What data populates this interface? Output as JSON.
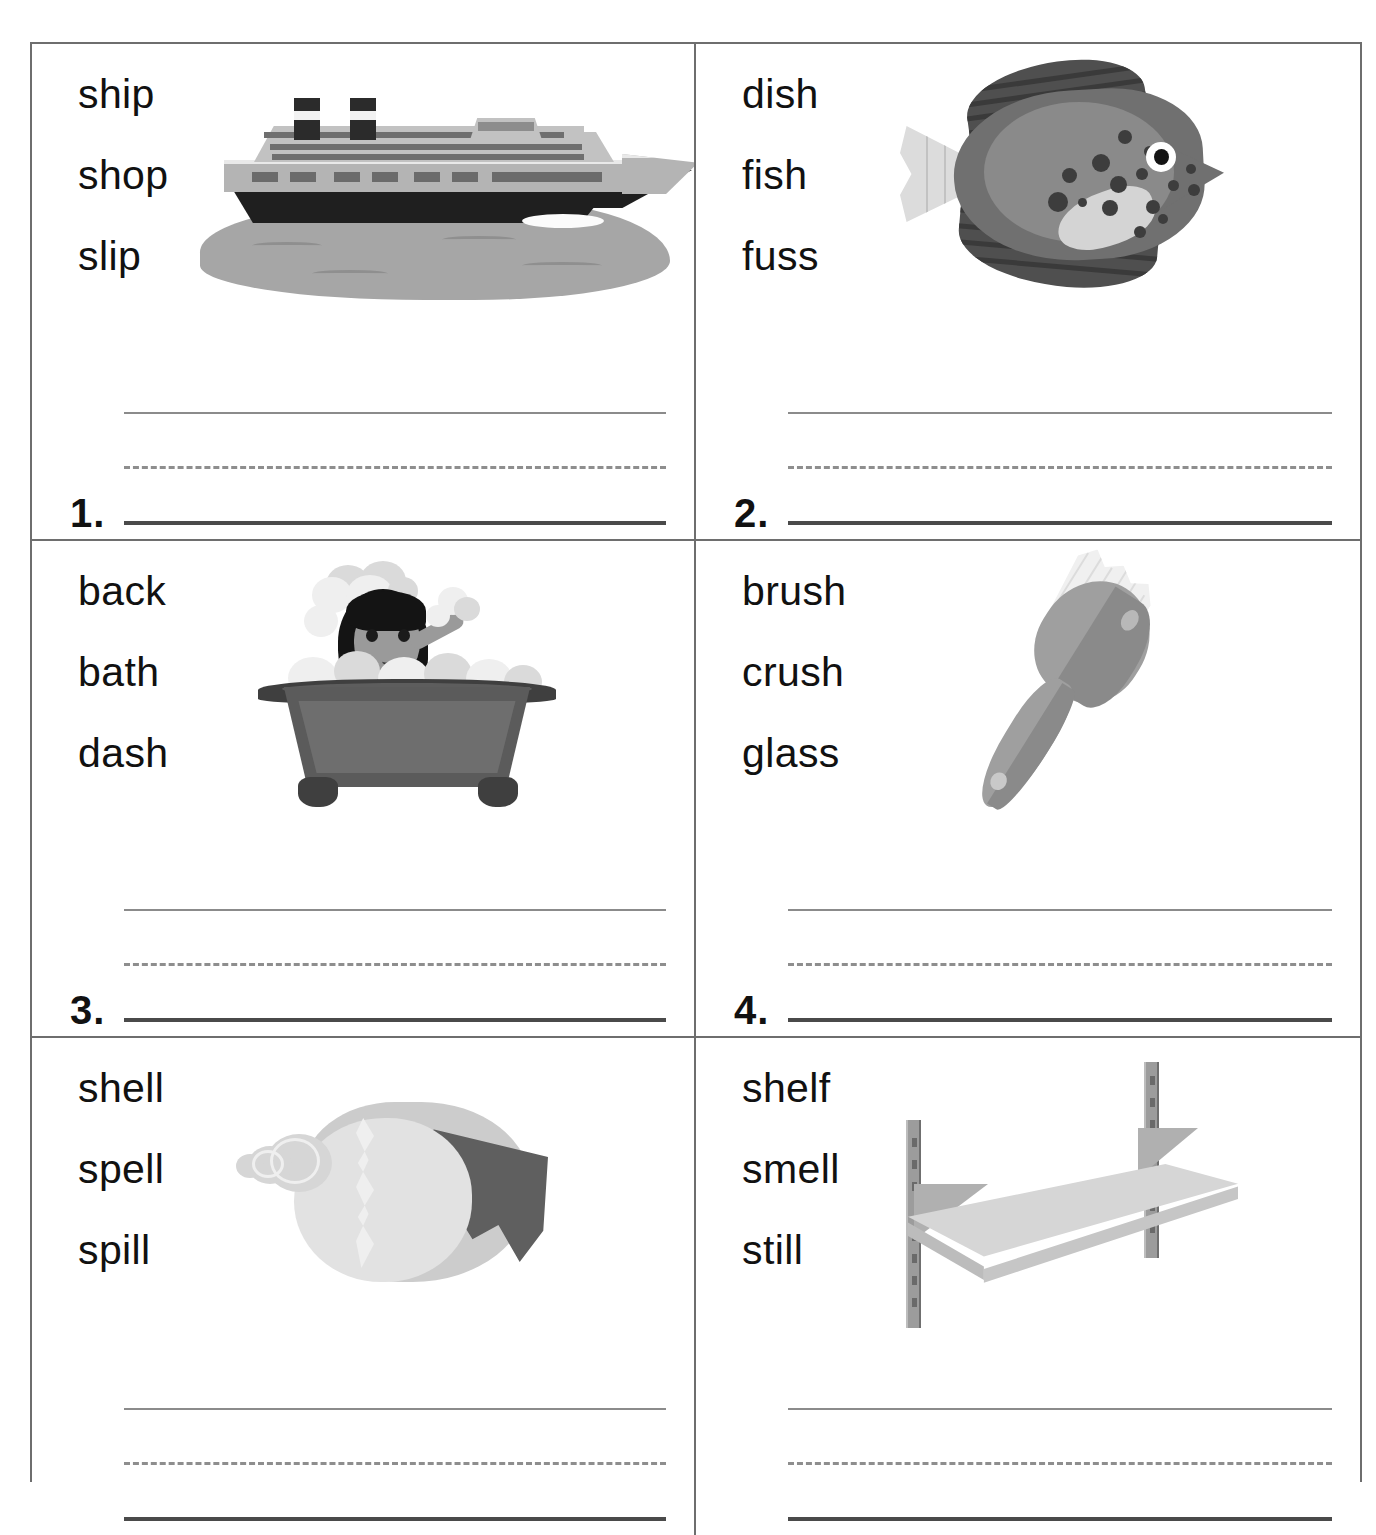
{
  "worksheet": {
    "type": "phonics-word-choice-worksheet",
    "grid": {
      "columns": 2,
      "rows": 3
    },
    "line_style": {
      "top_rule": "solid",
      "middle_rule": "dashed",
      "baseline": "solid"
    },
    "colors": {
      "border": "#6e6e6e",
      "text": "#111111",
      "rule_light": "#8b8b8b",
      "rule_dash": "#8e8e8e",
      "rule_base": "#4a4a4a",
      "background": "#ffffff"
    },
    "items": [
      {
        "number": "1.",
        "words": [
          "ship",
          "shop",
          "slip"
        ],
        "picture": "cruise-ship",
        "picture_label": "ship"
      },
      {
        "number": "2.",
        "words": [
          "dish",
          "fish",
          "fuss"
        ],
        "picture": "fish",
        "picture_label": "fish"
      },
      {
        "number": "3.",
        "words": [
          "back",
          "bath",
          "dash"
        ],
        "picture": "girl-in-bathtub",
        "picture_label": "bath"
      },
      {
        "number": "4.",
        "words": [
          "brush",
          "crush",
          "glass"
        ],
        "picture": "hair-brush",
        "picture_label": "brush"
      },
      {
        "number": "",
        "words": [
          "shell",
          "spell",
          "spill"
        ],
        "picture": "sea-shell",
        "picture_label": "shell"
      },
      {
        "number": "",
        "words": [
          "shelf",
          "smell",
          "still"
        ],
        "picture": "wall-shelf",
        "picture_label": "shelf"
      }
    ]
  }
}
